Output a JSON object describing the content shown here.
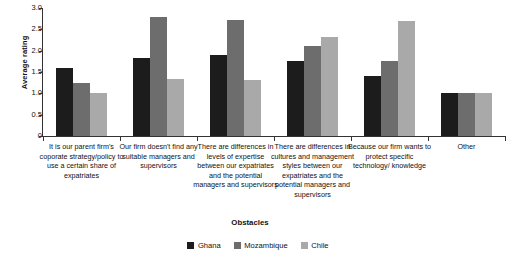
{
  "chart_data": {
    "type": "bar",
    "title": "",
    "xlabel": "Obstacles",
    "ylabel": "Average rating",
    "ylim": [
      0,
      3.0
    ],
    "ytick_labels": [
      "0",
      "0.5",
      "1.0",
      "1.5",
      "2.0",
      "2.5",
      "3.0"
    ],
    "ytick_values": [
      0,
      0.5,
      1.0,
      1.5,
      2.0,
      2.5,
      3.0
    ],
    "grid": false,
    "legend_position": "bottom-center",
    "categories": [
      "It is our parent firm's coporate strategy/policy to use a certain share of expatriates",
      "Our firm doesn't find any suitable managers and supervisors",
      "There are differences in levels of expertise between our expatriates and  the potential managers and supervisors",
      "There are differences in cultures and management styles between our expatriates and the potential managers and supervisors",
      "Because our firm wants to protect specific technology/ knowledge",
      "Other"
    ],
    "series": [
      {
        "name": "Ghana",
        "color": "#1c1c1c",
        "values": [
          1.6,
          1.84,
          1.9,
          1.75,
          1.4,
          1.0
        ]
      },
      {
        "name": "Mozambique",
        "color": "#6d6d6d",
        "values": [
          1.24,
          2.79,
          2.73,
          2.1,
          1.75,
          1.0
        ]
      },
      {
        "name": "Chile",
        "color": "#a9a9a9",
        "values": [
          1.0,
          1.33,
          1.31,
          2.33,
          2.7,
          1.0
        ]
      }
    ]
  },
  "legend": {
    "items": [
      {
        "label": "Ghana",
        "color": "#1c1c1c"
      },
      {
        "label": "Mozambique",
        "color": "#6d6d6d"
      },
      {
        "label": "Chile",
        "color": "#a9a9a9"
      }
    ]
  }
}
